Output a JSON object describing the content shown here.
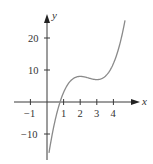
{
  "chart_data": {
    "type": "line",
    "title": "",
    "xlabel": "x",
    "ylabel": "y",
    "function": "y = 2x^3 - 15x^2 + 36x - 20",
    "xlim": [
      -1.5,
      5.5
    ],
    "ylim": [
      -15.5,
      27
    ],
    "x_ticks": [
      -1,
      1,
      2,
      3,
      4
    ],
    "x_tick_labels": [
      "−1",
      "1",
      "2",
      "3",
      "4"
    ],
    "y_ticks": [
      -10,
      10,
      20
    ],
    "y_tick_labels": [
      "−10",
      "10",
      "20"
    ],
    "grid": false,
    "legend": null,
    "series": [
      {
        "name": "f(x)",
        "color": "#8a8a8a",
        "x": [
          0.12,
          0.3,
          0.5,
          0.78,
          1.0,
          1.5,
          2.0,
          2.5,
          3.0,
          3.5,
          4.0,
          4.3,
          4.7
        ],
        "y": [
          -15.9,
          -10.5,
          -5.0,
          0.0,
          3.0,
          7.0,
          8.0,
          7.5,
          7.0,
          8.0,
          12.0,
          16.0,
          25.6
        ]
      }
    ],
    "key_points": {
      "x_intercept": 0.78,
      "local_max": [
        2,
        8
      ],
      "local_min": [
        3,
        7
      ]
    }
  },
  "labels": {
    "x_axis": "x",
    "y_axis": "y",
    "tick_neg1": "−1",
    "tick_1": "1",
    "tick_2": "2",
    "tick_3": "3",
    "tick_4": "4",
    "tick_20": "20",
    "tick_10": "10",
    "tick_neg10": "−10"
  },
  "colors": {
    "axis": "#3a3a3a",
    "curve": "#8a8a8a",
    "background": "#ffffff"
  }
}
